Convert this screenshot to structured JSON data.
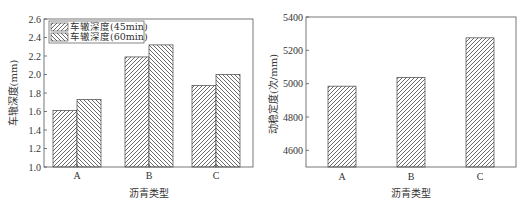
{
  "chart_data": [
    {
      "type": "bar",
      "title": "",
      "xlabel": "沥青类型",
      "ylabel": "车辙深度(mm)",
      "categories": [
        "A",
        "B",
        "C"
      ],
      "series": [
        {
          "name": "车辙深度(45min)",
          "values": [
            1.61,
            2.19,
            1.88
          ],
          "hatch": "forward-diagonal"
        },
        {
          "name": "车辙深度(60min)",
          "values": [
            1.73,
            2.32,
            2.0
          ],
          "hatch": "back-diagonal"
        }
      ],
      "ylim": [
        1.0,
        2.6
      ],
      "yticks": [
        "1.0",
        "1.2",
        "1.4",
        "1.6",
        "1.8",
        "2.0",
        "2.2",
        "2.4",
        "2.6"
      ],
      "legend_position": "upper-left",
      "grid": false
    },
    {
      "type": "bar",
      "title": "",
      "xlabel": "沥青类型",
      "ylabel": "动稳定度(次/mm)",
      "categories": [
        "A",
        "B",
        "C"
      ],
      "values": [
        4985,
        5038,
        5275
      ],
      "ylim": [
        4500,
        5400
      ],
      "yticks": [
        "4600",
        "4800",
        "5000",
        "5200",
        "5400"
      ],
      "hatch": "forward-diagonal",
      "grid": false
    }
  ]
}
